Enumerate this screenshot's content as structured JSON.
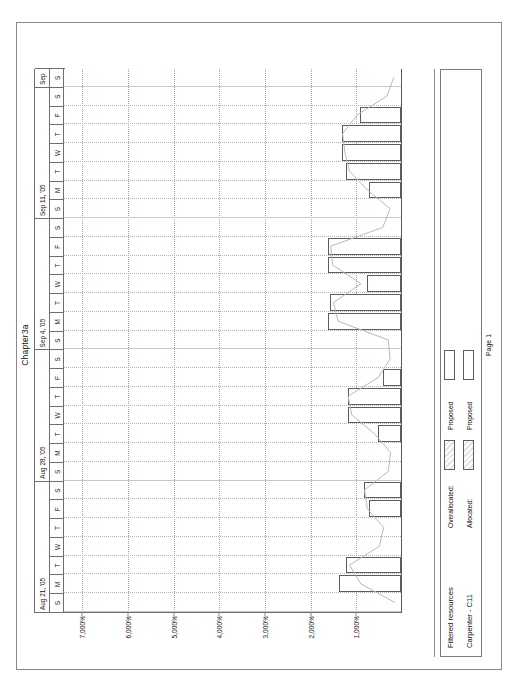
{
  "report": {
    "title": "Chapter3a",
    "page_label": "Page 1"
  },
  "legend": {
    "filtered_title": "Filtered resources",
    "resource_title": "Carpenter - C11",
    "overallocated_label": "Overallocated:",
    "overallocated_value": "Proposed",
    "allocated_label": "Allocated:",
    "allocated_value": "Proposed"
  },
  "chart_data": {
    "type": "bar",
    "title": "Chapter3a",
    "xlabel": "",
    "ylabel": "",
    "ylim": [
      0,
      7400
    ],
    "yticks": [
      1000,
      2000,
      3000,
      4000,
      5000,
      6000,
      7000
    ],
    "ytick_labels": [
      "1,000%",
      "2,000%",
      "3,000%",
      "4,000%",
      "5,000%",
      "6,000%",
      "7,000%"
    ],
    "grid": true,
    "legend_position": "bottom",
    "weeks": [
      {
        "label": "Aug 21, '05",
        "days": [
          "S",
          "M",
          "T",
          "W",
          "T",
          "F",
          "S"
        ]
      },
      {
        "label": "Aug 28, '05",
        "days": [
          "S",
          "M",
          "T",
          "W",
          "T",
          "F",
          "S"
        ]
      },
      {
        "label": "Sep 4, '05",
        "days": [
          "S",
          "M",
          "T",
          "W",
          "T",
          "F",
          "S"
        ]
      },
      {
        "label": "Sep 11, '05",
        "days": [
          "S",
          "M",
          "T",
          "W",
          "T",
          "F",
          "S"
        ]
      },
      {
        "label": "Sep",
        "days": [
          "S"
        ]
      }
    ],
    "categories": [
      "Aug 21 S",
      "Aug 21 M",
      "Aug 21 T",
      "Aug 21 W",
      "Aug 21 T",
      "Aug 21 F",
      "Aug 21 S",
      "Aug 28 S",
      "Aug 28 M",
      "Aug 28 T",
      "Aug 28 W",
      "Aug 28 T",
      "Aug 28 F",
      "Aug 28 S",
      "Sep 4 S",
      "Sep 4 M",
      "Sep 4 T",
      "Sep 4 W",
      "Sep 4 T",
      "Sep 4 F",
      "Sep 4 S",
      "Sep 11 S",
      "Sep 11 M",
      "Sep 11 T",
      "Sep 11 W",
      "Sep 11 T",
      "Sep 11 F",
      "Sep 11 S",
      "Sep S"
    ],
    "series": [
      {
        "name": "Allocated: Proposed",
        "values": [
          0,
          1350,
          1200,
          0,
          0,
          700,
          800,
          0,
          0,
          500,
          1150,
          1150,
          400,
          0,
          0,
          1600,
          1550,
          750,
          1600,
          1600,
          0,
          0,
          700,
          1200,
          1300,
          1300,
          900,
          0,
          0
        ]
      }
    ],
    "overlay_line": {
      "name": "Overallocated: Proposed",
      "values": [
        150,
        900,
        1150,
        500,
        400,
        760,
        820,
        300,
        250,
        600,
        1100,
        1180,
        520,
        260,
        300,
        1400,
        1500,
        900,
        1520,
        1560,
        420,
        260,
        760,
        1150,
        1250,
        1300,
        980,
        330,
        180
      ]
    }
  }
}
